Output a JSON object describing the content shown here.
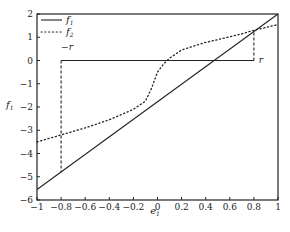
{
  "chart_data": {
    "type": "line",
    "title": "",
    "xlabel": "e",
    "xlabel_sub": "1",
    "ylabel": "f",
    "ylabel_sub": "1",
    "xlim": [
      -1,
      1
    ],
    "ylim": [
      -6,
      2
    ],
    "x_ticks": [
      -1,
      -0.8,
      -0.6,
      -0.4,
      -0.2,
      0,
      0.2,
      0.4,
      0.6,
      0.8,
      1
    ],
    "x_tick_labels": [
      "−1",
      "−0.8",
      "−0.6",
      "−0.4",
      "−0.2",
      "0",
      "0.2",
      "0.4",
      "0.6",
      "0.8",
      "1"
    ],
    "y_ticks": [
      2,
      1,
      0,
      -1,
      -2,
      -3,
      -4,
      -5,
      -6
    ],
    "y_tick_labels": [
      "2",
      "1",
      "0",
      "−1",
      "−2",
      "−3",
      "−4",
      "−5",
      "−6"
    ],
    "grid": false,
    "legend_position": "upper left",
    "series": [
      {
        "name": "f1",
        "label": "f",
        "label_sub": "1",
        "style": "solid",
        "x": [
          -1,
          1
        ],
        "y": [
          -5.55,
          2
        ]
      },
      {
        "name": "f2",
        "label": "f",
        "label_sub": "2",
        "style": "dotted",
        "x": [
          -1,
          -0.8,
          -0.6,
          -0.4,
          -0.2,
          -0.1,
          -0.05,
          0,
          0.05,
          0.1,
          0.2,
          0.3,
          0.4,
          0.5,
          0.6,
          0.7,
          0.8,
          0.9,
          1
        ],
        "y": [
          -3.5,
          -3.2,
          -2.9,
          -2.55,
          -2.1,
          -1.75,
          -1.2,
          -0.5,
          -0.15,
          0.1,
          0.45,
          0.62,
          0.78,
          0.9,
          1.02,
          1.15,
          1.3,
          1.42,
          1.55
        ]
      }
    ],
    "annotations": [
      {
        "type": "hline",
        "style": "solid",
        "y": 0,
        "x_from": -0.8,
        "x_to": 0.8
      },
      {
        "type": "vline",
        "style": "dashed",
        "x": -0.8,
        "y_from": 0,
        "y_to": -4.8
      },
      {
        "type": "vline",
        "style": "dashed",
        "x": 0.8,
        "y_from": 0,
        "y_to": 1.25
      },
      {
        "type": "text",
        "text": "−r",
        "x": -0.8,
        "y": 0.45
      },
      {
        "type": "text",
        "text": "r",
        "x": 0.84,
        "y": -0.1
      }
    ]
  }
}
